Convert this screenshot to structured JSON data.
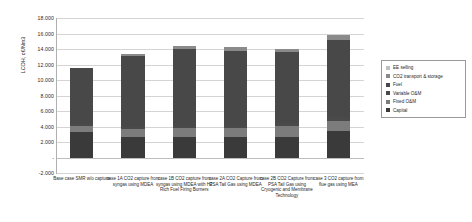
{
  "chart_data": {
    "type": "bar",
    "stacked": true,
    "title": "",
    "xlabel": "",
    "ylabel": "LCOH, c€/Nm3",
    "ylim": [
      -2000,
      18000
    ],
    "ytick_step": 2000,
    "ytick_labels": [
      "18.000",
      "16.000",
      "14.000",
      "12.000",
      "10.000",
      "8.000",
      "6.000",
      "4.000",
      "2.000",
      "-",
      "-2.000"
    ],
    "ytick_values": [
      18000,
      16000,
      14000,
      12000,
      10000,
      8000,
      6000,
      4000,
      2000,
      0,
      -2000
    ],
    "grid": true,
    "legend_position": "right",
    "categories": [
      "Base case  SMR w/o capture",
      "case 1A  CO2 capture from syngas using MDEA",
      "case 1B  CO2 capture from syngas using MDEA with H2 Rich Fuel Firing Burners",
      "case 2A  CO2 Capture from PSA Tail Gas using MDEA",
      "case 2B  CO2 Capture from PSA Tail Gas using Cryogenic and Membrane Technology",
      "case 3  CO2 capture from flue gas using MEA"
    ],
    "series": [
      {
        "name": "Capital",
        "color": "#3a3a3a",
        "values": [
          3250,
          2620,
          2700,
          2700,
          2700,
          3450
        ]
      },
      {
        "name": "Fixed O&M",
        "color": "#7c7c7c",
        "values": [
          760,
          1000,
          1050,
          1050,
          1400,
          1300
        ]
      },
      {
        "name": "Variable O&M",
        "color": "#4a4a4a",
        "values": [
          300,
          300,
          300,
          300,
          300,
          500
        ]
      },
      {
        "name": "Fuel",
        "color": "#484848",
        "values": [
          7200,
          9150,
          9900,
          9750,
          9200,
          9900
        ]
      },
      {
        "name": "CO2 transport & storage",
        "color": "#8a8a8a",
        "values": [
          0,
          330,
          500,
          500,
          400,
          700
        ]
      },
      {
        "name": "EE selling",
        "color": "#bfbfbf",
        "values": [
          0,
          0,
          0,
          0,
          0,
          0
        ]
      }
    ],
    "totals": [
      11510,
      13400,
      14450,
      14300,
      14000,
      15850
    ]
  },
  "legend": {
    "items": [
      {
        "label": "EE selling",
        "color": "#bfbfbf"
      },
      {
        "label": "CO2 transport & storage",
        "color": "#8a8a8a"
      },
      {
        "label": "Fuel",
        "color": "#484848"
      },
      {
        "label": "Variable O&M",
        "color": "#4a4a4a"
      },
      {
        "label": "Fixed O&M",
        "color": "#7c7c7c"
      },
      {
        "label": "Capital",
        "color": "#3a3a3a"
      }
    ]
  },
  "axis": {
    "y_title": "LCOH, c€/Nm3"
  }
}
